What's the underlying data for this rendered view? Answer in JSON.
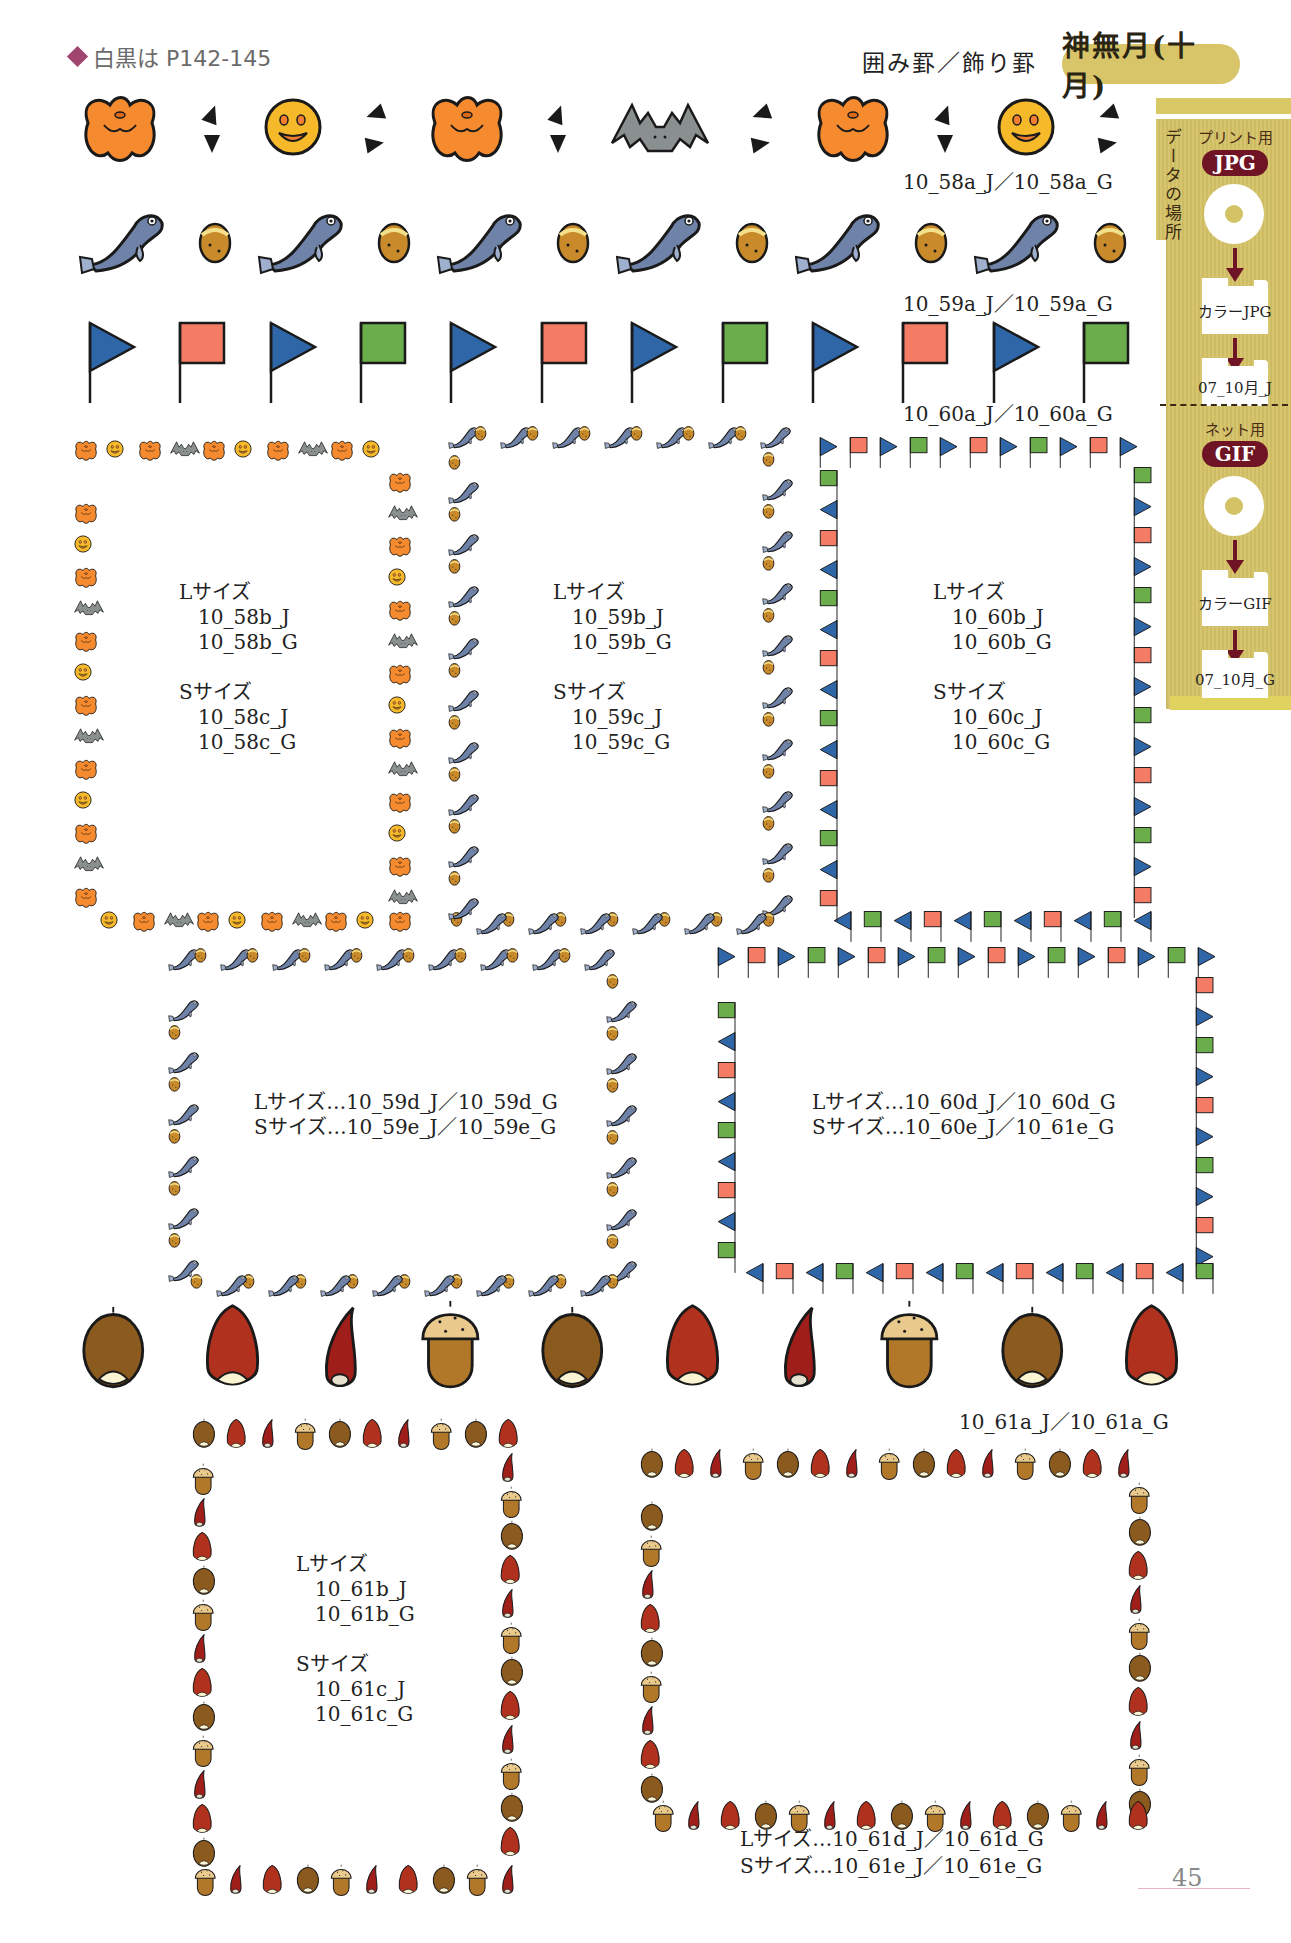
{
  "header": {
    "monochrome_ref": "白黒は P142-145",
    "category": "囲み罫／飾り罫",
    "month": "神無月(十月)"
  },
  "side_panel": {
    "vertical_label": "データの場所",
    "print": {
      "usage": "プリント用",
      "format": "JPG",
      "folder1": "カラーJPG",
      "folder2": "07_10月_J"
    },
    "web": {
      "usage": "ネット用",
      "format": "GIF",
      "folder1": "カラーGIF",
      "folder2": "07_10月_G"
    }
  },
  "colors": {
    "pumpkin": "#f58a2e",
    "smiley": "#f5b92a",
    "bat": "#8a9090",
    "fish": "#6f82a8",
    "acorn_small": "#c88a2a",
    "flag_blue": "#2f66a8",
    "flag_red": "#f47c64",
    "flag_green": "#6aad4a",
    "chestnut_brown": "#8a5a1e",
    "chestnut_red": "#b0321e",
    "acorn_body": "#b2782a",
    "acorn_cap": "#e9c98c",
    "gold_panel": "#d4c266",
    "maroon": "#6e1424"
  },
  "strips": [
    {
      "id": "10_58a",
      "caption": "10_58a_J／10_58a_G",
      "pattern": [
        "pumpkin",
        "tri",
        "smiley",
        "tri",
        "pumpkin",
        "tri",
        "bat",
        "tri",
        "pumpkin",
        "tri",
        "smiley",
        "tri"
      ]
    },
    {
      "id": "10_59a",
      "caption": "10_59a_J／10_59a_G",
      "pattern": [
        "fish",
        "acorn",
        "fish",
        "acorn",
        "fish",
        "acorn",
        "fish",
        "acorn",
        "fish",
        "acorn",
        "fish",
        "acorn"
      ]
    },
    {
      "id": "10_60a",
      "caption": "10_60a_J／10_60a_G",
      "pattern": [
        "fb",
        "fr",
        "fb",
        "fg",
        "fb",
        "fr",
        "fb",
        "fg",
        "fb",
        "fr",
        "fb",
        "fg"
      ]
    },
    {
      "id": "10_61a",
      "caption": "10_61a_J／10_61a_G",
      "pattern": [
        "cb",
        "cr",
        "cs",
        "ac",
        "cb",
        "cr",
        "cs",
        "ac",
        "cb",
        "cr"
      ]
    }
  ],
  "frames": [
    {
      "id": "f58",
      "style": "halloween",
      "lines": [
        "Lサイズ",
        "   10_58b_J",
        "   10_58b_G",
        "",
        "Sサイズ",
        "   10_58c_J",
        "   10_58c_G"
      ]
    },
    {
      "id": "f59",
      "style": "fish",
      "lines": [
        "Lサイズ",
        "   10_59b_J",
        "   10_59b_G",
        "",
        "Sサイズ",
        "   10_59c_J",
        "   10_59c_G"
      ]
    },
    {
      "id": "f60",
      "style": "flags",
      "lines": [
        "Lサイズ",
        "   10_60b_J",
        "   10_60b_G",
        "",
        "Sサイズ",
        "   10_60c_J",
        "   10_60c_G"
      ]
    },
    {
      "id": "f59de",
      "style": "fish",
      "lines": [
        "Lサイズ…10_59d_J／10_59d_G",
        "Sサイズ…10_59e_J／10_59e_G"
      ]
    },
    {
      "id": "f60de",
      "style": "flags",
      "lines": [
        "Lサイズ…10_60d_J／10_60d_G",
        "Sサイズ…10_60e_J／10_61e_G"
      ]
    },
    {
      "id": "f61",
      "style": "nuts",
      "lines": [
        "Lサイズ",
        "   10_61b_J",
        "   10_61b_G",
        "",
        "Sサイズ",
        "   10_61c_J",
        "   10_61c_G"
      ]
    },
    {
      "id": "f61de",
      "style": "nuts",
      "lines": []
    }
  ],
  "frame_61de_caption": [
    "Lサイズ…10_61d_J／10_61d_G",
    "Sサイズ…10_61e_J／10_61e_G"
  ],
  "page_number": "45"
}
